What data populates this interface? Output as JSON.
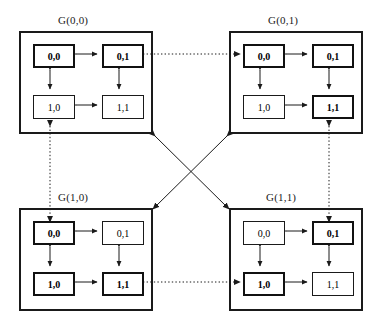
{
  "figure": {
    "type": "hierarchical-interconnection-network-diagram",
    "colors": {
      "line": "#1a1a1a",
      "node_fill": "#ffffff",
      "background": "#ffffff"
    }
  },
  "clusters": [
    {
      "id": "g00",
      "label": "G(0,0)",
      "x": 19,
      "y": 31,
      "w": 134,
      "h": 103,
      "label_x": 58,
      "label_y": 14,
      "nodes": [
        {
          "id": "n00",
          "label": "0,0",
          "bold": true,
          "x": 12,
          "y": 11,
          "w": 42,
          "h": 24
        },
        {
          "id": "n01",
          "label": "0,1",
          "bold": true,
          "x": 81,
          "y": 11,
          "w": 42,
          "h": 24
        },
        {
          "id": "n10",
          "label": "1,0",
          "bold": false,
          "x": 12,
          "y": 62,
          "w": 42,
          "h": 24
        },
        {
          "id": "n11",
          "label": "1,1",
          "bold": false,
          "x": 81,
          "y": 62,
          "w": 42,
          "h": 24
        }
      ]
    },
    {
      "id": "g01",
      "label": "G(0,1)",
      "x": 229,
      "y": 31,
      "w": 134,
      "h": 103,
      "label_x": 268,
      "label_y": 14,
      "nodes": [
        {
          "id": "n00",
          "label": "0,0",
          "bold": true,
          "x": 12,
          "y": 11,
          "w": 42,
          "h": 24
        },
        {
          "id": "n01",
          "label": "0,1",
          "bold": true,
          "x": 81,
          "y": 11,
          "w": 42,
          "h": 24
        },
        {
          "id": "n10",
          "label": "1,0",
          "bold": false,
          "x": 12,
          "y": 62,
          "w": 42,
          "h": 24
        },
        {
          "id": "n11",
          "label": "1,1",
          "bold": true,
          "x": 81,
          "y": 62,
          "w": 42,
          "h": 24
        }
      ]
    },
    {
      "id": "g10",
      "label": "G(1,0)",
      "x": 19,
      "y": 208,
      "w": 134,
      "h": 103,
      "label_x": 58,
      "label_y": 191,
      "nodes": [
        {
          "id": "n00",
          "label": "0,0",
          "bold": true,
          "x": 12,
          "y": 11,
          "w": 42,
          "h": 24
        },
        {
          "id": "n01",
          "label": "0,1",
          "bold": false,
          "x": 81,
          "y": 11,
          "w": 42,
          "h": 24
        },
        {
          "id": "n10",
          "label": "1,0",
          "bold": true,
          "x": 12,
          "y": 62,
          "w": 42,
          "h": 24
        },
        {
          "id": "n11",
          "label": "1,1",
          "bold": true,
          "x": 81,
          "y": 62,
          "w": 42,
          "h": 24
        }
      ]
    },
    {
      "id": "g11",
      "label": "G(1,1)",
      "x": 229,
      "y": 208,
      "w": 134,
      "h": 103,
      "label_x": 266,
      "label_y": 191,
      "nodes": [
        {
          "id": "n00",
          "label": "0,0",
          "bold": false,
          "x": 12,
          "y": 11,
          "w": 42,
          "h": 24
        },
        {
          "id": "n01",
          "label": "0,1",
          "bold": true,
          "x": 81,
          "y": 11,
          "w": 42,
          "h": 24
        },
        {
          "id": "n10",
          "label": "1,0",
          "bold": true,
          "x": 12,
          "y": 62,
          "w": 42,
          "h": 24
        },
        {
          "id": "n11",
          "label": "1,1",
          "bold": false,
          "x": 81,
          "y": 62,
          "w": 42,
          "h": 24
        }
      ]
    }
  ],
  "intra_cluster_links": {
    "style": "solid",
    "arrow": "double",
    "pairs": [
      {
        "from": "0,0",
        "to": "0,1",
        "orientation": "horizontal-top"
      },
      {
        "from": "1,0",
        "to": "1,1",
        "orientation": "horizontal-bottom"
      },
      {
        "from": "0,0",
        "to": "1,0",
        "orientation": "vertical-left"
      },
      {
        "from": "0,1",
        "to": "1,1",
        "orientation": "vertical-right"
      }
    ]
  },
  "inter_cluster_links": [
    {
      "id": "top-horizontal",
      "style": "dotted",
      "arrow": "double",
      "from": "G(0,0).0,1",
      "to": "G(0,1).0,0"
    },
    {
      "id": "bottom-horizontal",
      "style": "dotted",
      "arrow": "double",
      "from": "G(1,0).1,1",
      "to": "G(1,1).1,0"
    },
    {
      "id": "left-vertical",
      "style": "dotted",
      "arrow": "double",
      "from": "G(0,0).1,0",
      "to": "G(1,0).0,0"
    },
    {
      "id": "right-vertical",
      "style": "dotted",
      "arrow": "double",
      "from": "G(0,1).1,1",
      "to": "G(1,1).0,1"
    },
    {
      "id": "diagonal-nw-se",
      "style": "solid",
      "arrow": "double",
      "from": "G(0,0) corner",
      "to": "G(1,1) corner"
    },
    {
      "id": "diagonal-ne-sw",
      "style": "solid",
      "arrow": "double",
      "from": "G(0,1) corner",
      "to": "G(1,0) corner"
    }
  ]
}
